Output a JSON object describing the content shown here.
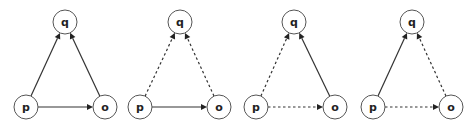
{
  "diagrams": [
    {
      "id": "graph-1",
      "nodes": [
        {
          "id": "q",
          "label": "q",
          "x": 65,
          "y": 22
        },
        {
          "id": "p",
          "label": "p",
          "x": 26,
          "y": 107
        },
        {
          "id": "o",
          "label": "o",
          "x": 105,
          "y": 107
        }
      ],
      "edges": [
        {
          "from": "p",
          "to": "q",
          "style": "solid"
        },
        {
          "from": "o",
          "to": "q",
          "style": "solid"
        },
        {
          "from": "p",
          "to": "o",
          "style": "solid"
        }
      ]
    },
    {
      "id": "graph-2",
      "nodes": [
        {
          "id": "q",
          "label": "q",
          "x": 180,
          "y": 22
        },
        {
          "id": "p",
          "label": "p",
          "x": 140,
          "y": 107
        },
        {
          "id": "o",
          "label": "o",
          "x": 219,
          "y": 107
        }
      ],
      "edges": [
        {
          "from": "p",
          "to": "q",
          "style": "dashed"
        },
        {
          "from": "o",
          "to": "q",
          "style": "dashed"
        },
        {
          "from": "p",
          "to": "o",
          "style": "solid"
        }
      ]
    },
    {
      "id": "graph-3",
      "nodes": [
        {
          "id": "q",
          "label": "q",
          "x": 294,
          "y": 22
        },
        {
          "id": "p",
          "label": "p",
          "x": 256,
          "y": 107
        },
        {
          "id": "o",
          "label": "o",
          "x": 335,
          "y": 107
        }
      ],
      "edges": [
        {
          "from": "p",
          "to": "q",
          "style": "dashed"
        },
        {
          "from": "o",
          "to": "q",
          "style": "solid"
        },
        {
          "from": "p",
          "to": "o",
          "style": "dashed"
        }
      ]
    },
    {
      "id": "graph-4",
      "nodes": [
        {
          "id": "q",
          "label": "q",
          "x": 412,
          "y": 22
        },
        {
          "id": "p",
          "label": "p",
          "x": 373,
          "y": 107
        },
        {
          "id": "o",
          "label": "o",
          "x": 451,
          "y": 107
        }
      ],
      "edges": [
        {
          "from": "p",
          "to": "q",
          "style": "solid"
        },
        {
          "from": "o",
          "to": "q",
          "style": "dashed"
        },
        {
          "from": "p",
          "to": "o",
          "style": "dashed"
        }
      ]
    }
  ],
  "node_radius": 12,
  "colors": {
    "node_stroke": "#555555",
    "edge": "#333333",
    "label": "#222222",
    "background": "#ffffff"
  }
}
